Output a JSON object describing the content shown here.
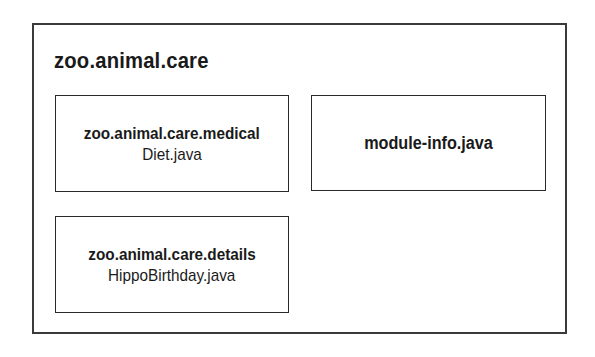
{
  "module": {
    "name": "zoo.animal.care",
    "packages": [
      {
        "name": "zoo.animal.care.medical",
        "files": [
          "Diet.java"
        ]
      },
      {
        "name": "zoo.animal.care.details",
        "files": [
          "HippoBirthday.java"
        ]
      }
    ],
    "descriptor": "module-info.java"
  },
  "colors": {
    "border": "#2a2a2a",
    "text": "#1a1a1a",
    "background": "#ffffff"
  }
}
